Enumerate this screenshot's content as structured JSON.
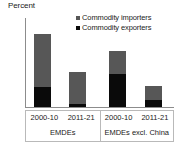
{
  "chart_data": {
    "type": "bar",
    "title": "",
    "subtitle": "",
    "xlabel": "",
    "ylabel": "Percent",
    "ylim": [
      0,
      12
    ],
    "yticks": [
      12,
      10,
      8,
      6,
      4,
      2,
      0
    ],
    "grid": false,
    "stacked": true,
    "legend_position": "top-right",
    "legend": [
      "Commodity importers",
      "Commodity exporters"
    ],
    "groups": [
      {
        "name": "EMDEs",
        "categories": [
          "2000-10",
          "2011-21"
        ]
      },
      {
        "name": "EMDEs excl. China",
        "categories": [
          "2000-10",
          "2011-21"
        ]
      }
    ],
    "categories": [
      "2000-10",
      "2011-21",
      "2000-10",
      "2011-21"
    ],
    "series": [
      {
        "name": "Commodity exporters",
        "color": "#0a0a0a",
        "values": [
          2.7,
          0.4,
          4.5,
          1.0
        ]
      },
      {
        "name": "Commodity importers",
        "color": "#575757",
        "values": [
          7.1,
          4.3,
          3.0,
          1.9
        ]
      }
    ],
    "totals": [
      9.8,
      4.7,
      7.5,
      2.9
    ],
    "bars": [
      {
        "group": "EMDEs",
        "category": "2000-10",
        "exporters": 2.7,
        "importers": 7.1,
        "total": 9.8
      },
      {
        "group": "EMDEs",
        "category": "2011-21",
        "exporters": 0.4,
        "importers": 4.3,
        "total": 4.7
      },
      {
        "group": "EMDEs excl. China",
        "category": "2000-10",
        "exporters": 4.5,
        "importers": 3.0,
        "total": 7.5
      },
      {
        "group": "EMDEs excl. China",
        "category": "2011-21",
        "exporters": 1.0,
        "importers": 1.9,
        "total": 2.9
      }
    ]
  },
  "colors": {
    "importers": "#575757",
    "exporters": "#0a0a0a",
    "axis": "#8c8c8c",
    "table_border": "#b9b9b9",
    "text": "#1a1a1a",
    "background": "#ffffff"
  }
}
